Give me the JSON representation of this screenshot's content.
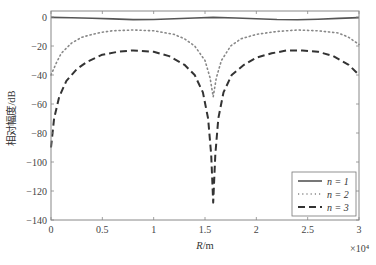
{
  "chart_data": {
    "type": "line",
    "title": "",
    "xlabel": "R/m",
    "ylabel": "相对幅度/dB",
    "x_multiplier": "×10⁴",
    "xlim": [
      0,
      3
    ],
    "ylim": [
      -140,
      5
    ],
    "xticks": [
      0,
      0.5,
      1,
      1.5,
      2,
      2.5,
      3
    ],
    "xtick_labels": [
      "0",
      "0.5",
      "1",
      "1.5",
      "2",
      "2.5",
      "3"
    ],
    "yticks": [
      0,
      -20,
      -40,
      -60,
      -80,
      -100,
      -120,
      -140
    ],
    "ytick_labels": [
      "0",
      "-20",
      "-40",
      "-60",
      "-80",
      "-100",
      "-120",
      "-140"
    ],
    "grid": false,
    "legend_position": "lower right",
    "series": [
      {
        "name": "n = 1",
        "style": "solid",
        "color": "#555555",
        "x": [
          0,
          0.2,
          0.4,
          0.6,
          0.8,
          1.0,
          1.2,
          1.4,
          1.58,
          1.8,
          2.0,
          2.2,
          2.4,
          2.6,
          2.8,
          3.0
        ],
        "y": [
          -0.3,
          -0.5,
          -0.9,
          -1.3,
          -1.8,
          -1.7,
          -1.2,
          -0.7,
          -0.3,
          -0.7,
          -1.2,
          -1.7,
          -1.9,
          -1.6,
          -1.0,
          -0.4
        ]
      },
      {
        "name": "n = 2",
        "style": "dotted",
        "color": "#888888",
        "x": [
          0,
          0.05,
          0.1,
          0.2,
          0.3,
          0.4,
          0.5,
          0.6,
          0.8,
          1.0,
          1.2,
          1.3,
          1.4,
          1.5,
          1.55,
          1.58,
          1.61,
          1.66,
          1.75,
          1.85,
          2.0,
          2.2,
          2.4,
          2.6,
          2.8,
          2.9,
          3.0
        ],
        "y": [
          -40,
          -32,
          -25,
          -18,
          -14,
          -12,
          -10.5,
          -9.5,
          -9,
          -9.5,
          -12,
          -15,
          -20,
          -30,
          -42,
          -55,
          -42,
          -30,
          -20,
          -15,
          -12,
          -10,
          -9,
          -9.5,
          -11,
          -14,
          -19
        ]
      },
      {
        "name": "n = 3",
        "style": "dashed",
        "color": "#333333",
        "x": [
          0,
          0.03,
          0.08,
          0.15,
          0.25,
          0.35,
          0.5,
          0.65,
          0.8,
          1.0,
          1.15,
          1.3,
          1.4,
          1.48,
          1.53,
          1.56,
          1.58,
          1.6,
          1.63,
          1.68,
          1.76,
          1.88,
          2.0,
          2.15,
          2.3,
          2.45,
          2.6,
          2.75,
          2.9,
          3.0
        ],
        "y": [
          -90,
          -70,
          -55,
          -44,
          -36,
          -31,
          -26,
          -24,
          -23,
          -24,
          -27,
          -33,
          -40,
          -52,
          -70,
          -95,
          -128,
          -95,
          -70,
          -52,
          -40,
          -33,
          -28,
          -25,
          -23,
          -23,
          -24,
          -27,
          -33,
          -40
        ]
      }
    ]
  },
  "legend": {
    "items": [
      {
        "label": "n = 1",
        "style": "solid"
      },
      {
        "label": "n = 2",
        "style": "dotted"
      },
      {
        "label": "n = 3",
        "style": "dashed"
      }
    ]
  },
  "labels": {
    "xlabel": "R/m",
    "ylabel": "相对幅度/dB",
    "x_multiplier": "×10⁴"
  }
}
